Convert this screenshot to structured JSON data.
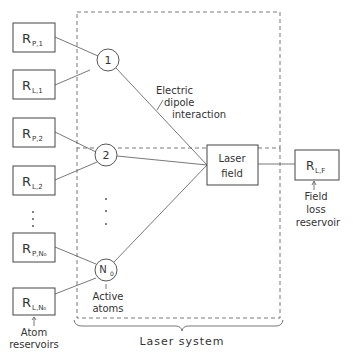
{
  "diagram": {
    "reservoirs": [
      {
        "main": "R",
        "sub": "P,1"
      },
      {
        "main": "R",
        "sub": "L,1"
      },
      {
        "main": "R",
        "sub": "P,2"
      },
      {
        "main": "R",
        "sub": "L,2"
      },
      {
        "main": "R",
        "sub": "P,N₀"
      },
      {
        "main": "R",
        "sub": "L,N₀"
      }
    ],
    "vertical_ellipsis": "⋮",
    "atoms": [
      {
        "label": "1"
      },
      {
        "label": "2"
      },
      {
        "label": "N",
        "sub": "0"
      }
    ],
    "laser_field": {
      "line1": "Laser",
      "line2": "field"
    },
    "field_loss_box": {
      "main": "R",
      "sub": "L,F"
    },
    "annotations": {
      "interaction_line1": "Electric",
      "interaction_line2": "dipole",
      "interaction_line3": "interaction",
      "active_line1": "Active",
      "active_line2": "atoms",
      "atom_res_line1": "Atom",
      "atom_res_line2": "reservoirs",
      "field_loss_line1": "Field",
      "field_loss_line2": "loss",
      "field_loss_line3": "reservoir",
      "system": "Laser system"
    }
  }
}
